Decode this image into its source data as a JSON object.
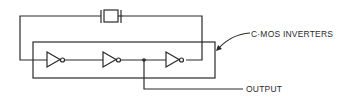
{
  "diagram": {
    "labels": {
      "inverters": "C·MOS INVERTERS",
      "output": "OUTPUT"
    },
    "components": [
      {
        "type": "crystal",
        "name": "quartz-crystal"
      },
      {
        "type": "inverter",
        "name": "inverter-1"
      },
      {
        "type": "inverter",
        "name": "inverter-2"
      },
      {
        "type": "inverter",
        "name": "inverter-3"
      }
    ],
    "colors": {
      "line": "#2a2a2a",
      "background": "#ffffff"
    }
  }
}
